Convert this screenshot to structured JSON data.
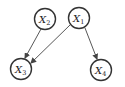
{
  "diagram": {
    "type": "directed-graph",
    "nodes": [
      {
        "id": "X1",
        "label": "X",
        "sub": "1",
        "cx": 79,
        "cy": 18
      },
      {
        "id": "X2",
        "label": "X",
        "sub": "2",
        "cx": 45,
        "cy": 19
      },
      {
        "id": "X3",
        "label": "X",
        "sub": "3",
        "cx": 21,
        "cy": 69
      },
      {
        "id": "X4",
        "label": "X",
        "sub": "4",
        "cx": 101,
        "cy": 70
      }
    ],
    "edges": [
      {
        "from": "X2",
        "to": "X3"
      },
      {
        "from": "X1",
        "to": "X3"
      },
      {
        "from": "X1",
        "to": "X4"
      }
    ],
    "colors": {
      "stroke": "#333333",
      "fill": "#ffffff"
    }
  }
}
